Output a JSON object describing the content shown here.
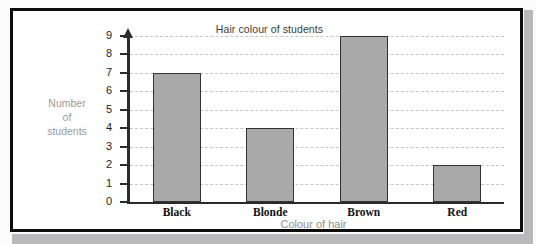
{
  "chart_data": {
    "type": "bar",
    "title": "Hair colour of students",
    "xlabel": "Colour of hair",
    "ylabel_lines": [
      "Number",
      "of",
      "students"
    ],
    "categories": [
      "Black",
      "Blonde",
      "Brown",
      "Red"
    ],
    "values": [
      7,
      4,
      9,
      2
    ],
    "ylim": [
      0,
      9
    ],
    "yticks": [
      0,
      1,
      2,
      3,
      4,
      5,
      6,
      7,
      8,
      9
    ],
    "ytick_labels": [
      "0",
      "1",
      "2",
      "3",
      "4",
      "5",
      "6",
      "7",
      "8",
      "9"
    ],
    "grid": true,
    "grid_style": "dashed",
    "legend": null,
    "bar_fill": "#a9a9a9",
    "bar_stroke": "#333333",
    "grid_color": "#c6c6c6",
    "axis_color": "#2b2b2b",
    "title_color": "#3a3a3a",
    "axis_label_color": "#9a9a9a"
  }
}
